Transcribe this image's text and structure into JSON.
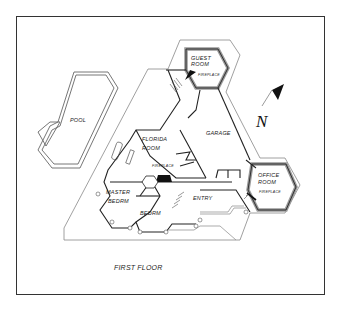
{
  "plan": {
    "title": "FIRST FLOOR",
    "north_label": "N",
    "colors": {
      "frame": "#333333",
      "line": "#222222",
      "outline": "#888888",
      "wall_fill": "#999999",
      "dark": "#111111"
    },
    "rooms": {
      "guest_room": {
        "line1": "GUEST",
        "line2": "ROOM",
        "fireplace": "FIREPLACE"
      },
      "garage": "GARAGE",
      "pool": "POOL",
      "florida_room": {
        "line1": "FLORIDA",
        "line2": "ROOM",
        "fireplace": "FIREPLACE"
      },
      "master_bedrm": {
        "line1": "MASTER",
        "line2": "BEDRM"
      },
      "bedrm": "BEDRM",
      "entry": "ENTRY",
      "office_room": {
        "line1": "OFFICE",
        "line2": "ROOM",
        "fireplace": "FIREPLACE"
      }
    }
  }
}
